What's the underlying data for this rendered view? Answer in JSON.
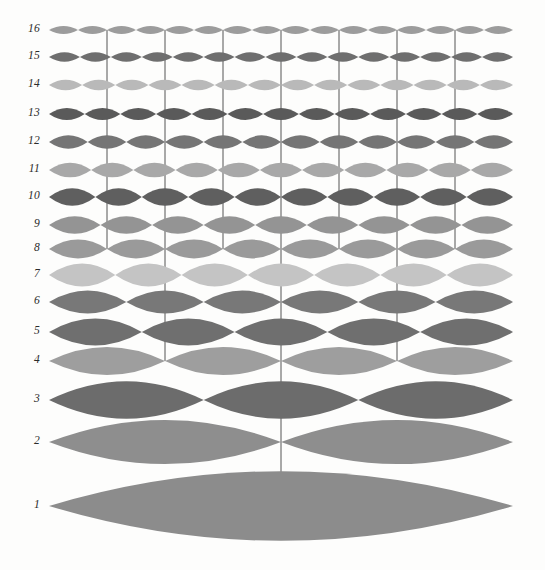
{
  "figure": {
    "background_color": "#fdfdfc",
    "node_line_color": "#555555",
    "label_color": "#2b2b2b",
    "string_left_x": 49,
    "string_right_x": 513,
    "string_span": 464
  },
  "chart_data": {
    "type": "line",
    "xlabel": "",
    "ylabel": "Harmonic number",
    "grid": false,
    "legend": false,
    "x_range": [
      49,
      513
    ],
    "categories": [
      "1",
      "2",
      "3",
      "4",
      "5",
      "6",
      "7",
      "8",
      "9",
      "10",
      "11",
      "12",
      "13",
      "14",
      "15",
      "16"
    ],
    "rows": [
      {
        "harmonic": 16,
        "label": "16",
        "lobes": 16,
        "y": 30,
        "amplitude": 6,
        "color": "#9c9c9c"
      },
      {
        "harmonic": 15,
        "label": "15",
        "lobes": 15,
        "y": 57,
        "amplitude": 7,
        "color": "#6e6e6e"
      },
      {
        "harmonic": 14,
        "label": "14",
        "lobes": 14,
        "y": 85,
        "amplitude": 8,
        "color": "#b9b9b9"
      },
      {
        "harmonic": 13,
        "label": "13",
        "lobes": 13,
        "y": 114,
        "amplitude": 9,
        "color": "#5a5a5a"
      },
      {
        "harmonic": 12,
        "label": "12",
        "lobes": 12,
        "y": 142,
        "amplitude": 10,
        "color": "#757575"
      },
      {
        "harmonic": 11,
        "label": "11",
        "lobes": 11,
        "y": 170,
        "amplitude": 11,
        "color": "#a8a8a8"
      },
      {
        "harmonic": 10,
        "label": "10",
        "lobes": 10,
        "y": 197,
        "amplitude": 13,
        "color": "#5f5f5f"
      },
      {
        "harmonic": 9,
        "label": "9",
        "lobes": 9,
        "y": 225,
        "amplitude": 13,
        "color": "#949494"
      },
      {
        "harmonic": 8,
        "label": "8",
        "lobes": 8,
        "y": 249,
        "amplitude": 14,
        "color": "#9a9a9a"
      },
      {
        "harmonic": 7,
        "label": "7",
        "lobes": 7,
        "y": 275,
        "amplitude": 17,
        "color": "#c4c4c4"
      },
      {
        "harmonic": 6,
        "label": "6",
        "lobes": 6,
        "y": 302,
        "amplitude": 17,
        "color": "#787878"
      },
      {
        "harmonic": 5,
        "label": "5",
        "lobes": 5,
        "y": 332,
        "amplitude": 20,
        "color": "#6f6f6f"
      },
      {
        "harmonic": 4,
        "label": "4",
        "lobes": 4,
        "y": 361,
        "amplitude": 21,
        "color": "#9e9e9e"
      },
      {
        "harmonic": 3,
        "label": "3",
        "lobes": 3,
        "y": 400,
        "amplitude": 28,
        "color": "#6c6c6c"
      },
      {
        "harmonic": 2,
        "label": "2",
        "lobes": 2,
        "y": 442,
        "amplitude": 33,
        "color": "#8e8e8e"
      },
      {
        "harmonic": 1,
        "label": "1",
        "lobes": 1,
        "y": 506,
        "amplitude": 52,
        "color": "#8c8c8c"
      }
    ],
    "node_connectors": [
      {
        "fraction": 0.5,
        "from_harmonic": 16,
        "to_harmonic": 1
      },
      {
        "fraction": 0.25,
        "from_harmonic": 16,
        "to_harmonic": 4
      },
      {
        "fraction": 0.75,
        "from_harmonic": 16,
        "to_harmonic": 4
      },
      {
        "fraction": 0.125,
        "from_harmonic": 16,
        "to_harmonic": 8
      },
      {
        "fraction": 0.375,
        "from_harmonic": 16,
        "to_harmonic": 8
      },
      {
        "fraction": 0.625,
        "from_harmonic": 16,
        "to_harmonic": 8
      },
      {
        "fraction": 0.875,
        "from_harmonic": 16,
        "to_harmonic": 8
      },
      {
        "fraction": 0.0625,
        "from_harmonic": 16,
        "to_harmonic": 16
      },
      {
        "fraction": 0.1875,
        "from_harmonic": 16,
        "to_harmonic": 16
      },
      {
        "fraction": 0.3125,
        "from_harmonic": 16,
        "to_harmonic": 16
      },
      {
        "fraction": 0.4375,
        "from_harmonic": 16,
        "to_harmonic": 16
      },
      {
        "fraction": 0.5625,
        "from_harmonic": 16,
        "to_harmonic": 16
      },
      {
        "fraction": 0.6875,
        "from_harmonic": 16,
        "to_harmonic": 16
      },
      {
        "fraction": 0.8125,
        "from_harmonic": 16,
        "to_harmonic": 16
      },
      {
        "fraction": 0.9375,
        "from_harmonic": 16,
        "to_harmonic": 16
      }
    ]
  }
}
